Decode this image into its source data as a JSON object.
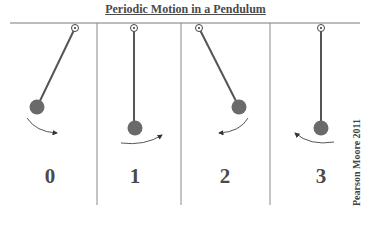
{
  "title": "Periodic Motion in a Pendulum",
  "credit": "Pearson Moore 2011",
  "colors": {
    "line": "#555555",
    "bob": "#6a6a6a",
    "text": "#4a4a4a",
    "divider": "#8a8a8a"
  },
  "panels": [
    {
      "label": "0",
      "state": "bob displaced left, swinging right",
      "arrow_direction": "right"
    },
    {
      "label": "1",
      "state": "bob at bottom (center), moving right",
      "arrow_direction": "right"
    },
    {
      "label": "2",
      "state": "bob displaced right, swinging left",
      "arrow_direction": "left"
    },
    {
      "label": "3",
      "state": "bob at bottom (center), moving left",
      "arrow_direction": "left"
    }
  ]
}
